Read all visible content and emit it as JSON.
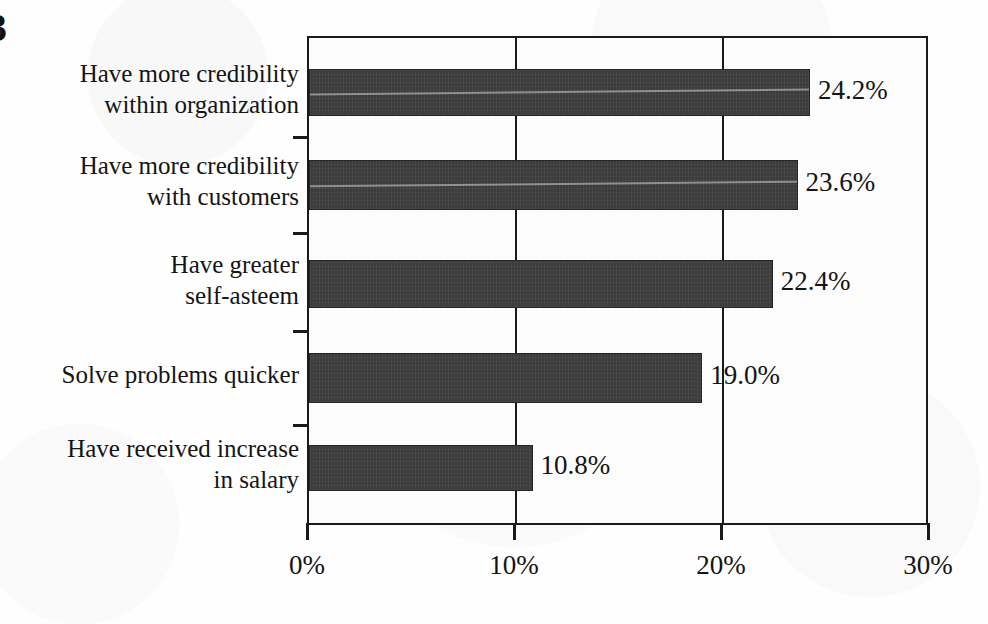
{
  "page_marker": "3",
  "chart_data": {
    "type": "bar",
    "orientation": "horizontal",
    "title": "",
    "xlabel": "",
    "ylabel": "",
    "xlim": [
      0,
      30
    ],
    "grid": true,
    "legend": null,
    "categories": [
      "Have more credibility\nwithin organization",
      "Have more credibility\nwith customers",
      "Have greater\nself-asteem",
      "Solve problems quicker",
      "Have received increase\nin salary"
    ],
    "values": [
      24.2,
      23.6,
      22.4,
      19.0,
      10.8
    ],
    "value_labels": [
      "24.2%",
      "23.6%",
      "22.4%",
      "19.0%",
      "10.8%"
    ],
    "x_ticks": [
      0,
      10,
      20,
      30
    ],
    "x_tick_labels": [
      "0%",
      "10%",
      "20%",
      "30%"
    ],
    "bar_color": "#3b3b3b",
    "axis_color": "#1a1a1a",
    "background_color": "#fcfcfc"
  }
}
